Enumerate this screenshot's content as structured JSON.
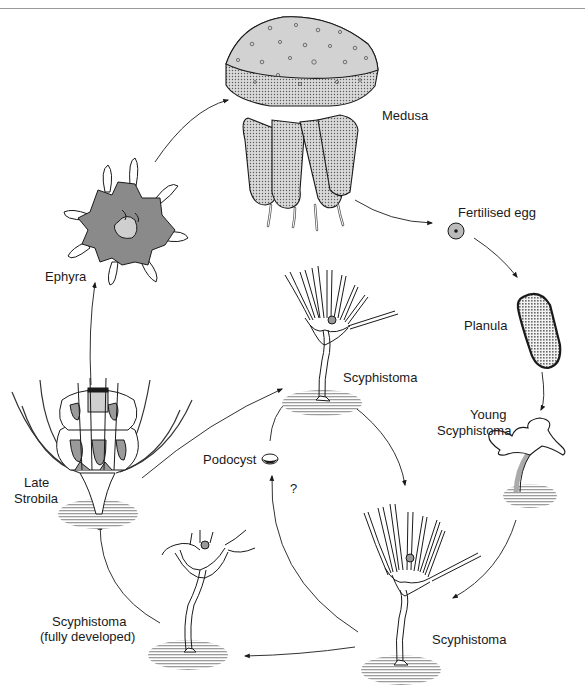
{
  "diagram": {
    "colors": {
      "ink": "#1a1a1a",
      "grey_fill": "#bdbdbd",
      "light_fill": "#d8d8d8",
      "dark_fill": "#8a8a8a",
      "substrate": "#9c9c9c"
    },
    "stages": [
      {
        "id": "medusa",
        "label": "Medusa"
      },
      {
        "id": "fertilised-egg",
        "label": "Fertilised egg"
      },
      {
        "id": "planula",
        "label": "Planula"
      },
      {
        "id": "young-scyphistoma",
        "label_line1": "Young",
        "label_line2": "Scyphistoma"
      },
      {
        "id": "scyphistoma-bottom-right",
        "label": "Scyphistoma"
      },
      {
        "id": "scyphistoma-fully-developed",
        "label_line1": "Scyphistoma",
        "label_line2": "(fully developed)"
      },
      {
        "id": "late-strobila",
        "label_line1": "Late",
        "label_line2": "Strobila"
      },
      {
        "id": "ephyra",
        "label": "Ephyra"
      },
      {
        "id": "scyphistoma-center",
        "label": "Scyphistoma"
      },
      {
        "id": "podocyst",
        "label": "Podocyst"
      }
    ],
    "annotations": {
      "question_mark": "?"
    },
    "arrows": [
      {
        "from": "ephyra",
        "to": "medusa"
      },
      {
        "from": "medusa",
        "to": "fertilised-egg"
      },
      {
        "from": "fertilised-egg",
        "to": "planula"
      },
      {
        "from": "planula",
        "to": "young-scyphistoma"
      },
      {
        "from": "young-scyphistoma",
        "to": "scyphistoma-bottom-right"
      },
      {
        "from": "scyphistoma-bottom-right",
        "to": "scyphistoma-fully-developed"
      },
      {
        "from": "scyphistoma-fully-developed",
        "to": "late-strobila"
      },
      {
        "from": "late-strobila",
        "to": "ephyra"
      },
      {
        "from": "late-strobila",
        "to": "scyphistoma-center"
      },
      {
        "from": "scyphistoma-center",
        "to": "scyphistoma-bottom-right"
      },
      {
        "from": "scyphistoma-bottom-right",
        "to": "podocyst"
      },
      {
        "from": "podocyst",
        "to": "scyphistoma-center"
      }
    ]
  }
}
